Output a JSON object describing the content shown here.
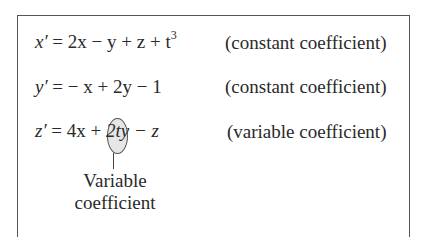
{
  "equations": [
    {
      "lhs": "x′",
      "rhs_prefix": " = 2x − y + z + t",
      "exponent": "3",
      "note": "(constant coefficient)"
    },
    {
      "lhs": "y′",
      "rhs_prefix": " = − x + 2y − 1",
      "exponent": "",
      "note": "(constant coefficient)"
    },
    {
      "lhs": "z′",
      "rhs_prefix": " = 4x + ",
      "highlight": "2t",
      "rhs_suffix": "y − z",
      "note": "(variable coefficient)"
    }
  ],
  "callout": {
    "line1": "Variable",
    "line2": "coefficient"
  }
}
